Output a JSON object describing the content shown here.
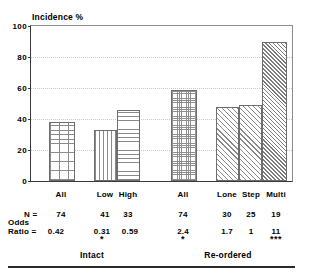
{
  "chart_data": {
    "type": "bar",
    "title": "Incidence %",
    "xlabel": "",
    "ylabel": "Incidence %",
    "ylim": [
      0,
      100
    ],
    "yticks": [
      0,
      20,
      40,
      60,
      80,
      100
    ],
    "grid": "horizontal-dotted",
    "legend": "none",
    "categories": [
      "All",
      "Low",
      "High",
      "All",
      "Lone",
      "Step",
      "Multi"
    ],
    "values": [
      38,
      33,
      45.5,
      59,
      47.5,
      49,
      90
    ],
    "series": [
      {
        "name": "Incidence %",
        "values": [
          38,
          33,
          45.5,
          59,
          47.5,
          49,
          90
        ]
      }
    ],
    "bar_patterns": [
      "crosshatch",
      "vertical-lines",
      "horizontal-lines",
      "fine-checker",
      "diagonal-hatch",
      "diagonal-hatch",
      "diagonal-hatch-dense"
    ],
    "groups": [
      {
        "label": "Intact",
        "categories": [
          "All",
          "Low",
          "High"
        ]
      },
      {
        "label": "Re-ordered",
        "categories": [
          "All",
          "Lone",
          "Step",
          "Multi"
        ]
      }
    ],
    "annotations": {
      "n_row_label": "N =",
      "odds_row_label_line1": "Odds",
      "odds_row_label_line2": "Ratio =",
      "n_values": [
        "74",
        "41",
        "33",
        "74",
        "30",
        "25",
        "19"
      ],
      "odds_ratios": [
        "0.42",
        "0.31",
        "0.59",
        "2.4",
        "1.7",
        "1",
        "11"
      ],
      "significance": [
        "",
        "*",
        "",
        "*",
        "",
        "",
        "***"
      ]
    }
  },
  "axis": {
    "title": "Incidence %",
    "tick_100": "100",
    "tick_80": "80",
    "tick_60": "60",
    "tick_40": "40",
    "tick_20": "20",
    "tick_0": "0"
  },
  "xlabels": {
    "b0": "All",
    "b1": "Low",
    "b2": "High",
    "b3": "All",
    "b4": "Lone",
    "b5": "Step",
    "b6": "Multi"
  },
  "n_row": {
    "head": "N =",
    "v0": "74",
    "v1": "41",
    "v2": "33",
    "v3": "74",
    "v4": "30",
    "v5": "25",
    "v6": "19"
  },
  "odds_row": {
    "head1": "Odds",
    "head2": "Ratio =",
    "v0": "0.42",
    "v1": "0.31",
    "v2": "0.59",
    "v3": "2.4",
    "v4": "1.7",
    "v5": "1",
    "v6": "11"
  },
  "sig_row": {
    "s1": "*",
    "s3": "*",
    "s6": "***"
  },
  "groups": {
    "left": "Intact",
    "right": "Re-ordered"
  },
  "colors": {
    "axis": "#3a3a3a",
    "grid": "#c9c9c9",
    "bar_outline": "#6e6e6e",
    "hatch": "#8a8a8a",
    "rule": "#2b2b2b"
  }
}
